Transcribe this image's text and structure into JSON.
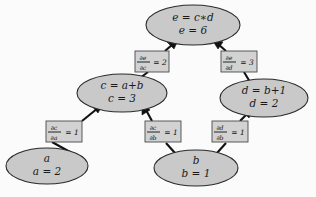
{
  "diagram": {
    "background_color": "#fbfbfb",
    "node_fill_color": "#c9c9c9",
    "node_stroke_color": "#2a2a2a",
    "box_fill_color": "#d2d2d2",
    "box_stroke_color": "#4a4a4a",
    "edge_color": "#111111"
  },
  "nodes": [
    {
      "id": "e",
      "line1": "e = c∗d",
      "line2": "e = 6",
      "cx": 193,
      "cy": 25,
      "rx": 47,
      "ry": 20
    },
    {
      "id": "c",
      "line1": "c = a+b",
      "line2": "c = 3",
      "cx": 122,
      "cy": 93,
      "rx": 45,
      "ry": 19
    },
    {
      "id": "d",
      "line1": "d = b+1",
      "line2": "d = 2",
      "cx": 264,
      "cy": 98,
      "rx": 44,
      "ry": 19
    },
    {
      "id": "a",
      "line1": "a",
      "line2": "a = 2",
      "cx": 47,
      "cy": 166,
      "rx": 41,
      "ry": 18
    },
    {
      "id": "b",
      "line1": "b",
      "line2": "b = 1",
      "cx": 196,
      "cy": 168,
      "rx": 42,
      "ry": 18
    }
  ],
  "derivative_labels": [
    {
      "id": "de-dc",
      "numerator": "∂e",
      "denominator": "∂c",
      "equals": "= 2",
      "value": "2",
      "x": 135,
      "y": 51,
      "w": 34,
      "h": 21
    },
    {
      "id": "de-dd",
      "numerator": "∂e",
      "denominator": "∂d",
      "equals": "= 3",
      "value": "3",
      "x": 221,
      "y": 51,
      "w": 36,
      "h": 21
    },
    {
      "id": "dc-da",
      "numerator": "∂c",
      "denominator": "∂a",
      "equals": "= 1",
      "value": "1",
      "x": 46,
      "y": 121,
      "w": 36,
      "h": 21
    },
    {
      "id": "dc-db",
      "numerator": "∂c",
      "denominator": "∂b",
      "equals": "= 1",
      "value": "1",
      "x": 145,
      "y": 121,
      "w": 36,
      "h": 21
    },
    {
      "id": "dd-db",
      "numerator": "∂d",
      "denominator": "∂b",
      "equals": "= 1",
      "value": "1",
      "x": 212,
      "y": 121,
      "w": 36,
      "h": 21
    }
  ],
  "edges": [
    {
      "id": "edge-a-to-c",
      "from": "a",
      "to": "c",
      "label": "dc-da"
    },
    {
      "id": "edge-b-to-c",
      "from": "b",
      "to": "c",
      "label": "dc-db"
    },
    {
      "id": "edge-b-to-d",
      "from": "b",
      "to": "d",
      "label": "dd-db"
    },
    {
      "id": "edge-c-to-e",
      "from": "c",
      "to": "e",
      "label": "de-dc"
    },
    {
      "id": "edge-d-to-e",
      "from": "d",
      "to": "e",
      "label": "de-dd"
    }
  ]
}
